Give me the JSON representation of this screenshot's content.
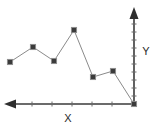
{
  "chart_data": {
    "type": "line",
    "title": "",
    "xlabel": "X",
    "ylabel": "Y",
    "orientation": "x-axis-arrow-left, y-axis-arrow-up, origin-bottom-right",
    "grid": false,
    "legend": null,
    "markers": "filled-square",
    "line_color": "#8a8a8a",
    "marker_color": "#3b3b3b",
    "axis_color": "#3a3a3a",
    "x": [
      1,
      2,
      3,
      4,
      5,
      6,
      7
    ],
    "values": [
      42,
      57,
      43,
      74,
      27,
      33,
      0
    ],
    "xlim": [
      0,
      7.5
    ],
    "ylim": [
      0,
      100
    ],
    "x_tick_count": 6,
    "y_tick_count": 11,
    "points_px": [
      {
        "x": 10,
        "y": 62
      },
      {
        "x": 33,
        "y": 47
      },
      {
        "x": 54,
        "y": 61
      },
      {
        "x": 74,
        "y": 30
      },
      {
        "x": 93,
        "y": 77
      },
      {
        "x": 113,
        "y": 71
      },
      {
        "x": 134,
        "y": 104
      }
    ],
    "annotations": []
  },
  "axes": {
    "x_label": "X",
    "y_label": "Y",
    "x_arrow_direction": "left",
    "y_arrow_direction": "up"
  },
  "icons": {
    "x_arrowhead": "arrow-left-icon",
    "y_arrowhead": "arrow-up-icon"
  }
}
